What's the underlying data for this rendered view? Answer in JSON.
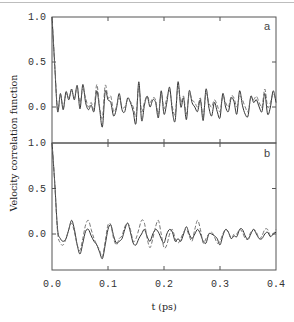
{
  "chart_data": [
    {
      "type": "line",
      "panel": "a",
      "ylabel": "Velocity correlation function",
      "xlabel": "t (ps)",
      "xlim": [
        0.0,
        0.4
      ],
      "ylim": [
        -0.4,
        1.0
      ],
      "yticks": [
        "1.0",
        "0.5",
        "0.0"
      ],
      "xticks": [
        "0.0",
        "0.1",
        "0.2",
        "0.3",
        "0.4"
      ],
      "grid": false,
      "series": [
        {
          "name": "solid",
          "style": "solid",
          "x": [
            0.0,
            0.005,
            0.01,
            0.015,
            0.02,
            0.025,
            0.03,
            0.035,
            0.04,
            0.045,
            0.05,
            0.055,
            0.06,
            0.065,
            0.07,
            0.075,
            0.08,
            0.085,
            0.09,
            0.095,
            0.1,
            0.105,
            0.11,
            0.115,
            0.12,
            0.125,
            0.13,
            0.135,
            0.14,
            0.145,
            0.15,
            0.155,
            0.16,
            0.165,
            0.17,
            0.175,
            0.18,
            0.185,
            0.19,
            0.195,
            0.2,
            0.205,
            0.21,
            0.215,
            0.22,
            0.225,
            0.23,
            0.235,
            0.24,
            0.245,
            0.25,
            0.255,
            0.26,
            0.265,
            0.27,
            0.275,
            0.28,
            0.285,
            0.29,
            0.295,
            0.3,
            0.305,
            0.31,
            0.315,
            0.32,
            0.325,
            0.33,
            0.335,
            0.34,
            0.345,
            0.35,
            0.355,
            0.36,
            0.365,
            0.37,
            0.375,
            0.38,
            0.385,
            0.39,
            0.395,
            0.4
          ],
          "y": [
            1.0,
            0.45,
            -0.05,
            0.15,
            -0.03,
            0.17,
            0.08,
            0.2,
            0.08,
            0.24,
            -0.02,
            0.25,
            0.05,
            -0.03,
            0.02,
            -0.05,
            0.18,
            -0.02,
            -0.22,
            0.17,
            0.08,
            0.05,
            -0.1,
            -0.02,
            0.15,
            -0.03,
            -0.05,
            0.1,
            0.05,
            -0.05,
            -0.18,
            0.28,
            -0.15,
            0.02,
            0.12,
            0.0,
            0.08,
            0.05,
            -0.12,
            0.18,
            -0.08,
            0.05,
            0.22,
            -0.05,
            -0.15,
            0.28,
            0.0,
            0.1,
            -0.14,
            0.18,
            0.05,
            0.0,
            -0.05,
            0.08,
            -0.15,
            0.2,
            0.0,
            -0.1,
            0.05,
            -0.05,
            -0.12,
            0.15,
            0.0,
            -0.05,
            0.1,
            0.06,
            -0.08,
            0.18,
            0.02,
            -0.08,
            -0.1,
            0.12,
            0.05,
            0.08,
            0.0,
            -0.05,
            0.15,
            -0.08,
            0.0,
            0.18,
            0.05
          ]
        },
        {
          "name": "dashed",
          "style": "dashed",
          "x": [
            0.0,
            0.005,
            0.01,
            0.015,
            0.02,
            0.025,
            0.03,
            0.035,
            0.04,
            0.045,
            0.05,
            0.055,
            0.06,
            0.065,
            0.07,
            0.075,
            0.08,
            0.085,
            0.09,
            0.095,
            0.1,
            0.105,
            0.11,
            0.115,
            0.12,
            0.125,
            0.13,
            0.135,
            0.14,
            0.145,
            0.15,
            0.155,
            0.16,
            0.165,
            0.17,
            0.175,
            0.18,
            0.185,
            0.19,
            0.195,
            0.2,
            0.205,
            0.21,
            0.215,
            0.22,
            0.225,
            0.23,
            0.235,
            0.24,
            0.245,
            0.25,
            0.255,
            0.26,
            0.265,
            0.27,
            0.275,
            0.28,
            0.285,
            0.29,
            0.295,
            0.3,
            0.305,
            0.31,
            0.315,
            0.32,
            0.325,
            0.33,
            0.335,
            0.34,
            0.345,
            0.35,
            0.355,
            0.36,
            0.365,
            0.37,
            0.375,
            0.38,
            0.385,
            0.39,
            0.395,
            0.4
          ],
          "y": [
            1.0,
            0.45,
            -0.03,
            0.13,
            -0.01,
            0.15,
            0.1,
            0.18,
            0.1,
            0.22,
            0.05,
            0.2,
            0.1,
            0.0,
            0.05,
            -0.02,
            0.25,
            0.0,
            -0.12,
            0.24,
            0.1,
            0.12,
            -0.05,
            0.0,
            0.1,
            0.0,
            0.0,
            0.08,
            0.06,
            0.0,
            -0.1,
            0.22,
            -0.05,
            0.05,
            0.12,
            0.05,
            0.1,
            0.08,
            -0.08,
            0.15,
            -0.02,
            0.1,
            0.18,
            0.0,
            -0.08,
            0.22,
            0.05,
            0.12,
            -0.08,
            0.15,
            0.08,
            0.05,
            0.0,
            0.1,
            -0.1,
            0.15,
            0.05,
            0.0,
            0.08,
            0.02,
            -0.05,
            0.12,
            0.05,
            0.0,
            0.12,
            0.1,
            0.0,
            0.12,
            0.08,
            0.0,
            -0.05,
            0.1,
            0.08,
            0.12,
            0.05,
            0.0,
            0.2,
            0.0,
            0.05,
            0.15,
            0.08
          ]
        }
      ]
    },
    {
      "type": "line",
      "panel": "b",
      "ylabel": "Velocity correlation function",
      "xlabel": "t (ps)",
      "xlim": [
        0.0,
        0.4
      ],
      "ylim": [
        -0.4,
        1.0
      ],
      "yticks": [
        "1.0",
        "0.5",
        "0.0"
      ],
      "xticks": [
        "0.0",
        "0.1",
        "0.2",
        "0.3",
        "0.4"
      ],
      "grid": false,
      "series": [
        {
          "name": "solid",
          "style": "solid",
          "x": [
            0.0,
            0.005,
            0.01,
            0.015,
            0.02,
            0.025,
            0.03,
            0.035,
            0.04,
            0.045,
            0.05,
            0.055,
            0.06,
            0.065,
            0.07,
            0.075,
            0.08,
            0.085,
            0.09,
            0.095,
            0.1,
            0.105,
            0.11,
            0.115,
            0.12,
            0.125,
            0.13,
            0.135,
            0.14,
            0.145,
            0.15,
            0.155,
            0.16,
            0.165,
            0.17,
            0.175,
            0.18,
            0.185,
            0.19,
            0.195,
            0.2,
            0.205,
            0.21,
            0.215,
            0.22,
            0.225,
            0.23,
            0.235,
            0.24,
            0.245,
            0.25,
            0.255,
            0.26,
            0.265,
            0.27,
            0.275,
            0.28,
            0.285,
            0.29,
            0.295,
            0.3,
            0.305,
            0.31,
            0.315,
            0.32,
            0.325,
            0.33,
            0.335,
            0.34,
            0.345,
            0.35,
            0.355,
            0.36,
            0.365,
            0.37,
            0.375,
            0.38,
            0.385,
            0.39,
            0.395,
            0.4
          ],
          "y": [
            1.0,
            0.55,
            0.05,
            -0.05,
            -0.08,
            -0.05,
            0.05,
            0.15,
            0.05,
            -0.12,
            -0.22,
            -0.1,
            0.03,
            0.05,
            -0.02,
            -0.08,
            -0.12,
            -0.2,
            -0.27,
            -0.12,
            0.05,
            0.1,
            -0.02,
            -0.1,
            -0.08,
            -0.05,
            0.05,
            0.12,
            0.02,
            -0.1,
            -0.12,
            -0.05,
            0.0,
            0.05,
            -0.03,
            -0.08,
            0.0,
            0.05,
            0.02,
            -0.05,
            -0.1,
            0.0,
            0.05,
            0.02,
            -0.08,
            -0.05,
            -0.08,
            0.0,
            0.08,
            0.0,
            -0.05,
            0.0,
            0.05,
            0.0,
            -0.08,
            -0.1,
            0.0,
            0.0,
            -0.02,
            -0.05,
            -0.12,
            -0.02,
            0.05,
            0.02,
            -0.05,
            -0.02,
            -0.03,
            0.05,
            0.05,
            -0.02,
            -0.06,
            0.0,
            0.05,
            0.0,
            -0.05,
            -0.05,
            0.0,
            0.02,
            -0.03,
            0.0,
            0.02
          ]
        },
        {
          "name": "dashed",
          "style": "dashed",
          "x": [
            0.0,
            0.005,
            0.01,
            0.015,
            0.02,
            0.025,
            0.03,
            0.035,
            0.04,
            0.045,
            0.05,
            0.055,
            0.06,
            0.065,
            0.07,
            0.075,
            0.08,
            0.085,
            0.09,
            0.095,
            0.1,
            0.105,
            0.11,
            0.115,
            0.12,
            0.125,
            0.13,
            0.135,
            0.14,
            0.145,
            0.15,
            0.155,
            0.16,
            0.165,
            0.17,
            0.175,
            0.18,
            0.185,
            0.19,
            0.195,
            0.2,
            0.205,
            0.21,
            0.215,
            0.22,
            0.225,
            0.23,
            0.235,
            0.24,
            0.245,
            0.25,
            0.255,
            0.26,
            0.265,
            0.27,
            0.275,
            0.28,
            0.285,
            0.29,
            0.295,
            0.3,
            0.305,
            0.31,
            0.315,
            0.32,
            0.325,
            0.33,
            0.335,
            0.34,
            0.345,
            0.35,
            0.355,
            0.36,
            0.365,
            0.37,
            0.375,
            0.38,
            0.385,
            0.39,
            0.395,
            0.4
          ],
          "y": [
            1.0,
            0.55,
            0.02,
            -0.1,
            -0.12,
            -0.05,
            0.05,
            0.12,
            0.02,
            -0.12,
            -0.18,
            -0.05,
            0.1,
            0.15,
            0.05,
            -0.05,
            -0.12,
            -0.18,
            -0.25,
            -0.08,
            0.1,
            0.1,
            -0.05,
            -0.12,
            -0.05,
            -0.02,
            0.08,
            0.12,
            0.05,
            -0.08,
            -0.05,
            0.05,
            0.15,
            0.12,
            -0.05,
            -0.15,
            -0.05,
            0.08,
            0.15,
            0.0,
            -0.15,
            -0.12,
            0.0,
            0.05,
            -0.05,
            -0.1,
            -0.05,
            0.02,
            0.05,
            -0.02,
            -0.08,
            0.05,
            0.15,
            0.05,
            -0.1,
            -0.05,
            0.0,
            0.02,
            -0.03,
            -0.1,
            -0.08,
            0.0,
            0.05,
            0.02,
            -0.05,
            0.0,
            0.0,
            0.05,
            0.02,
            -0.05,
            -0.05,
            0.02,
            0.05,
            0.02,
            -0.05,
            -0.02,
            0.05,
            0.05,
            -0.02,
            0.0,
            0.05
          ]
        }
      ]
    }
  ],
  "axes": {
    "ylabel": "Velocity correlation function",
    "xlabel": "t (ps)",
    "panel_a_label": "a",
    "panel_b_label": "b",
    "yticks_a": [
      "1.0",
      "0.5",
      "0.0"
    ],
    "yticks_b": [
      "1.0",
      "0.5",
      "0.0"
    ],
    "xticks": [
      "0.0",
      "0.1",
      "0.2",
      "0.3",
      "0.4"
    ]
  },
  "colors": {
    "axis": "#555555",
    "line": "#333333",
    "dashed": "#555555",
    "text": "#333333"
  }
}
